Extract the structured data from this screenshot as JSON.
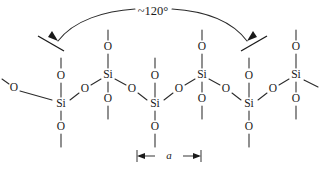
{
  "figure": {
    "kind": "chemical-structure-diagram",
    "background_color": "#ffffff",
    "line_color": "#2b2b2b",
    "text_color": "#1a1a1a"
  },
  "annotations": {
    "bond_angle_label": "~120°",
    "lattice_label": "a"
  },
  "atoms": {
    "silicon_symbol": "Si",
    "oxygen_symbol": "O",
    "silicon_positions": [
      {
        "id": "si-lower-1",
        "x": 61,
        "y": 104,
        "row": "lower"
      },
      {
        "id": "si-upper-1",
        "x": 108,
        "y": 75,
        "row": "upper"
      },
      {
        "id": "si-lower-2",
        "x": 155,
        "y": 104,
        "row": "lower"
      },
      {
        "id": "si-upper-2",
        "x": 202,
        "y": 75,
        "row": "upper"
      },
      {
        "id": "si-lower-3",
        "x": 249,
        "y": 104,
        "row": "lower"
      },
      {
        "id": "si-upper-3",
        "x": 296,
        "y": 75,
        "row": "upper"
      }
    ],
    "oxygen_positions": [
      {
        "id": "o-terminal-left",
        "x": 14,
        "y": 88,
        "kind": "terminal"
      },
      {
        "id": "o-bridge-1",
        "x": 85,
        "y": 89,
        "kind": "bridging"
      },
      {
        "id": "o-bridge-2",
        "x": 132,
        "y": 89,
        "kind": "bridging"
      },
      {
        "id": "o-bridge-3",
        "x": 179,
        "y": 89,
        "kind": "bridging"
      },
      {
        "id": "o-bridge-4",
        "x": 226,
        "y": 89,
        "kind": "bridging"
      },
      {
        "id": "o-bridge-5",
        "x": 273,
        "y": 89,
        "kind": "bridging"
      },
      {
        "id": "o-above-si-lower-1",
        "x": 61,
        "y": 76,
        "kind": "axial-up"
      },
      {
        "id": "o-above-si-lower-2",
        "x": 155,
        "y": 76,
        "kind": "axial-up"
      },
      {
        "id": "o-above-si-lower-3",
        "x": 249,
        "y": 76,
        "kind": "axial-up"
      },
      {
        "id": "o-below-si-lower-1",
        "x": 61,
        "y": 127,
        "kind": "axial-down"
      },
      {
        "id": "o-below-si-lower-2",
        "x": 155,
        "y": 127,
        "kind": "axial-down"
      },
      {
        "id": "o-below-si-lower-3",
        "x": 249,
        "y": 127,
        "kind": "axial-down"
      },
      {
        "id": "o-above-si-upper-1",
        "x": 108,
        "y": 47,
        "kind": "axial-up"
      },
      {
        "id": "o-above-si-upper-2",
        "x": 202,
        "y": 47,
        "kind": "axial-up"
      },
      {
        "id": "o-above-si-upper-3",
        "x": 296,
        "y": 47,
        "kind": "axial-up"
      },
      {
        "id": "o-below-si-upper-1",
        "x": 108,
        "y": 99,
        "kind": "axial-down"
      },
      {
        "id": "o-below-si-upper-2",
        "x": 202,
        "y": 99,
        "kind": "axial-down"
      },
      {
        "id": "o-below-si-upper-3",
        "x": 296,
        "y": 99,
        "kind": "axial-down"
      }
    ]
  },
  "dimension": {
    "left_x": 137,
    "right_x": 201,
    "y": 156,
    "label": "a"
  }
}
